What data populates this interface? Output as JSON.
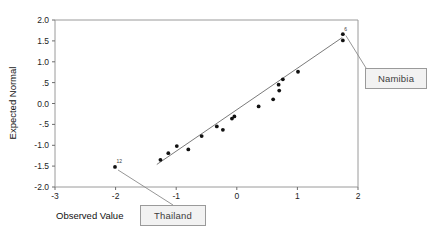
{
  "chart_data": {
    "type": "scatter",
    "title": "",
    "xlabel": "Observed Value",
    "ylabel": "Expected Normal",
    "xlim": [
      -3,
      2
    ],
    "ylim": [
      -2.0,
      2.0
    ],
    "xticks": [
      -3,
      -2,
      -1,
      0,
      1,
      2
    ],
    "xtick_labels": [
      "-3",
      "-2",
      "-1",
      "0",
      "1",
      "2"
    ],
    "yticks": [
      -2.0,
      -1.5,
      -1.0,
      -0.5,
      0.0,
      0.5,
      1.0,
      1.5,
      2.0
    ],
    "ytick_labels": [
      "-2.0",
      "-1.5",
      "-1.0",
      "-.5",
      "0.0",
      ".5",
      "1.0",
      "1.5",
      "2.0"
    ],
    "grid": false,
    "legend": "none",
    "marker_color": "#111111",
    "line_color": "#6b6b6b",
    "frame_color": "#9a9a9a",
    "points": [
      {
        "x": -2.01,
        "y": -1.52,
        "label": "12"
      },
      {
        "x": -1.26,
        "y": -1.35,
        "label": ""
      },
      {
        "x": -1.13,
        "y": -1.19,
        "label": ""
      },
      {
        "x": -0.99,
        "y": -1.02,
        "label": ""
      },
      {
        "x": -0.8,
        "y": -1.1,
        "label": ""
      },
      {
        "x": -0.58,
        "y": -0.78,
        "label": ""
      },
      {
        "x": -0.33,
        "y": -0.55,
        "label": ""
      },
      {
        "x": -0.23,
        "y": -0.63,
        "label": ""
      },
      {
        "x": -0.08,
        "y": -0.36,
        "label": ""
      },
      {
        "x": -0.04,
        "y": -0.31,
        "label": ""
      },
      {
        "x": 0.36,
        "y": -0.07,
        "label": ""
      },
      {
        "x": 0.6,
        "y": 0.1,
        "label": ""
      },
      {
        "x": 0.69,
        "y": 0.45,
        "label": ""
      },
      {
        "x": 0.7,
        "y": 0.31,
        "label": ""
      },
      {
        "x": 0.76,
        "y": 0.58,
        "label": ""
      },
      {
        "x": 1.01,
        "y": 0.76,
        "label": ""
      },
      {
        "x": 1.75,
        "y": 1.66,
        "label": "6"
      },
      {
        "x": 1.75,
        "y": 1.51,
        "label": ""
      }
    ],
    "fit_line": {
      "x0": -1.32,
      "y0": -1.46,
      "x1": 1.74,
      "y1": 1.58
    }
  },
  "annotations": [
    {
      "name": "thailand",
      "text": "Thailand",
      "target_point": {
        "x": -2.01,
        "y": -1.52
      }
    },
    {
      "name": "namibia",
      "text": "Namibia",
      "target_point": {
        "x": 1.75,
        "y": 1.58
      }
    }
  ]
}
